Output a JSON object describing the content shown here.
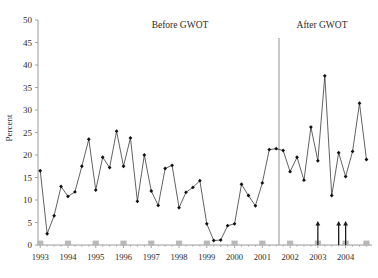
{
  "figure": {
    "title_fragment": "",
    "y_axis_title": "Percent"
  },
  "annotations": {
    "before_label": "Before  GWOT",
    "after_label": "After  GWOT",
    "divider_name": "gwot-divider-line",
    "arrow_count": 3
  },
  "chart_data": {
    "type": "line",
    "title": "",
    "subtitle": "",
    "xlabel": "",
    "ylabel": "Percent",
    "ylim": [
      0,
      50
    ],
    "ytick_labels": [
      "0",
      "5",
      "10",
      "15",
      "20",
      "25",
      "30",
      "35",
      "40",
      "45",
      "50"
    ],
    "ytick_values": [
      0,
      5,
      10,
      15,
      20,
      25,
      30,
      35,
      40,
      45,
      50
    ],
    "xtick_labels": [
      "1993",
      "1994",
      "1995",
      "1996",
      "1997",
      "1998",
      "1999",
      "2000",
      "2001",
      "2002",
      "2003",
      "2004"
    ],
    "xtick_values": [
      1993,
      1994,
      1995,
      1996,
      1997,
      1998,
      1999,
      2000,
      2001,
      2002,
      2003,
      2004
    ],
    "grid": false,
    "legend": "none",
    "marker": "diamond",
    "x_period": "quarterly",
    "series": [
      {
        "name": "Percent",
        "x": [
          1993.0,
          1993.25,
          1993.5,
          1993.75,
          1994.0,
          1994.25,
          1994.5,
          1994.75,
          1995.0,
          1995.25,
          1995.5,
          1995.75,
          1996.0,
          1996.25,
          1996.5,
          1996.75,
          1997.0,
          1997.25,
          1997.5,
          1997.75,
          1998.0,
          1998.25,
          1998.5,
          1998.75,
          1999.0,
          1999.25,
          1999.5,
          1999.75,
          2000.0,
          2000.25,
          2000.5,
          2000.75,
          2001.0,
          2001.25,
          2001.5,
          2001.75,
          2002.0,
          2002.25,
          2002.5,
          2002.75,
          2003.0,
          2003.25,
          2003.5,
          2003.75,
          2004.0,
          2004.25,
          2004.5,
          2004.75
        ],
        "values": [
          16.5,
          2.5,
          6.5,
          13.0,
          10.8,
          11.8,
          17.5,
          23.5,
          12.2,
          19.5,
          17.2,
          25.3,
          17.5,
          23.8,
          9.7,
          20.0,
          12.0,
          8.8,
          17.0,
          17.7,
          8.3,
          11.7,
          12.8,
          14.3,
          4.7,
          1.0,
          1.1,
          4.3,
          4.7,
          13.5,
          11.0,
          8.7,
          13.8,
          21.2,
          21.4,
          21.0,
          16.3,
          19.5,
          14.4,
          26.2,
          18.7,
          37.6,
          11.0,
          20.5,
          15.2,
          20.8,
          31.5,
          19.0
        ]
      }
    ],
    "baseline_markers": {
      "name": "quarter-baseline-squares",
      "value": 0,
      "color": "#b8b8b8",
      "x": [
        1993,
        1994,
        1995,
        1996,
        1997,
        1998,
        1999,
        2000,
        2001,
        2002,
        2003,
        2004,
        2004.75
      ]
    },
    "event_arrows": {
      "name": "event-arrow",
      "color": "#1a1a1a",
      "x": [
        2003.0,
        2003.75,
        2004.0
      ],
      "top_value": 4.6
    },
    "divider": {
      "x": 2001.6,
      "top_value": 46,
      "color": "#9a9a9a"
    }
  },
  "colors": {
    "line": "#3a3a3a",
    "marker": "#111111",
    "axis": "#9a9a9a",
    "text": "#2b2b2b",
    "baseline_square": "#b8b8b8",
    "divider": "#9a9a9a",
    "background": "#ffffff"
  }
}
